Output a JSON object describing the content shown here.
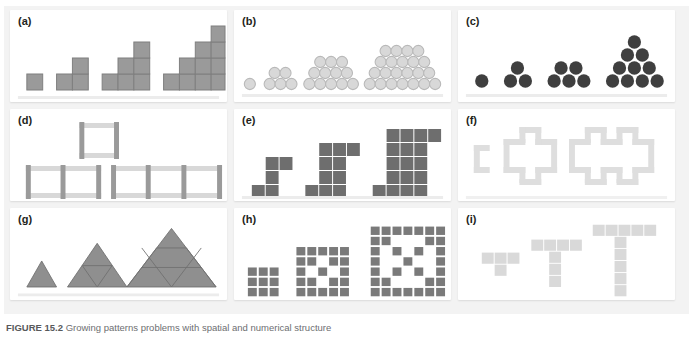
{
  "figure": {
    "caption_label": "FIGURE 15.2",
    "caption_text": "Growing patterns problems with spatial and numerical structure",
    "background": "#f3f3f3",
    "panel_background": "#ffffff"
  },
  "colors": {
    "mid_gray": "#9a9a9a",
    "mid_gray_stroke": "#8a8a8a",
    "light_gray": "#d4d4d4",
    "light_gray_stroke": "#c2c2c2",
    "dark_gray": "#3f3f3f",
    "block_gray": "#6e6e6e",
    "pale_gray": "#e2e2e2",
    "label_color": "#231f20"
  },
  "panels": [
    {
      "id": "a",
      "label": "(a)",
      "name": "panel-a-staircase-squares",
      "type": "staircase-squares",
      "description": "Square tiles arranged in growing staircase shapes",
      "fill": "#9a9a9a",
      "stroke": "#7f7f7f",
      "cell": 14,
      "terms": [
        {
          "index": 1,
          "columns": [
            1
          ],
          "count": 1
        },
        {
          "index": 2,
          "columns": [
            1,
            2
          ],
          "count": 3
        },
        {
          "index": 3,
          "columns": [
            1,
            2,
            3
          ],
          "count": 6
        },
        {
          "index": 4,
          "columns": [
            1,
            2,
            3,
            4
          ],
          "count": 10
        }
      ]
    },
    {
      "id": "b",
      "label": "(b)",
      "name": "panel-b-circle-stacks",
      "type": "circle-triangular-stacks",
      "description": "Light circles stacked in triangular arrays",
      "fill": "#d8d8d8",
      "stroke": "#b9b9b9",
      "radius": 5.2,
      "terms": [
        {
          "index": 1,
          "rows": [
            1
          ],
          "count": 1
        },
        {
          "index": 2,
          "rows": [
            3,
            2
          ],
          "count": 5
        },
        {
          "index": 3,
          "rows": [
            5,
            4,
            3
          ],
          "count": 12
        },
        {
          "index": 4,
          "rows": [
            7,
            6,
            5,
            4
          ],
          "count": 22
        }
      ]
    },
    {
      "id": "c",
      "label": "(c)",
      "name": "panel-c-dark-triangular-numbers",
      "type": "circle-triangles",
      "description": "Dark circles forming triangular numbers",
      "fill": "#3f3f3f",
      "stroke": "#3f3f3f",
      "radius": 6.4,
      "terms": [
        {
          "index": 1,
          "rows": [
            1
          ],
          "count": 1
        },
        {
          "index": 2,
          "rows": [
            2,
            1
          ],
          "count": 3
        },
        {
          "index": 3,
          "rows": [
            3,
            2
          ],
          "count": 5
        },
        {
          "index": 4,
          "rows": [
            5,
            4,
            3,
            2,
            1
          ],
          "count": 15
        }
      ]
    },
    {
      "id": "d",
      "label": "(d)",
      "name": "panel-d-matchstick-squares",
      "type": "matchstick-squares",
      "description": "Toothpick or matchstick squares joined in a row",
      "fill": "#cfcfcf",
      "post_fill": "#8d8d8d",
      "stroke": "#bdbdbd",
      "terms": [
        {
          "index": 1,
          "squares": 1,
          "sticks": 4
        },
        {
          "index": 2,
          "squares": 2,
          "sticks": 7
        },
        {
          "index": 3,
          "squares": 3,
          "sticks": 10
        }
      ]
    },
    {
      "id": "e",
      "label": "(e)",
      "name": "panel-e-block-growth",
      "type": "block-growth",
      "description": "Dark block arrangements growing in width and height",
      "fill": "#6e6e6e",
      "stroke": "#ffffff",
      "cell": 11,
      "terms": [
        {
          "index": 1,
          "count": 5
        },
        {
          "index": 2,
          "count": 12
        },
        {
          "index": 3,
          "count": 22
        }
      ]
    },
    {
      "id": "f",
      "label": "(f)",
      "name": "panel-f-perimeter-fractal",
      "type": "perimeter-outline",
      "description": "Pale gray outlined cross and Koch-island perimeters",
      "fill": "#dedede",
      "stroke": "#cfcfcf",
      "cell": 9,
      "terms": [
        {
          "index": 1,
          "perimeter": 8
        },
        {
          "index": 2,
          "perimeter": 20
        },
        {
          "index": 3,
          "perimeter": 32
        }
      ]
    },
    {
      "id": "g",
      "label": "(g)",
      "name": "panel-g-subdivided-triangles",
      "type": "triangles",
      "description": "Equilateral triangles subdivided into smaller triangles",
      "fill": "#8f8f8f",
      "stroke": "#6f6f6f",
      "terms": [
        {
          "index": 1,
          "side": 1,
          "small_triangles": 1
        },
        {
          "index": 2,
          "side": 2,
          "small_triangles": 4
        },
        {
          "index": 3,
          "side": 3,
          "small_triangles": 9
        }
      ]
    },
    {
      "id": "h",
      "label": "(h)",
      "name": "panel-h-square-fractal",
      "type": "square-fractal",
      "description": "Square grids of small tiles forming nested fractal rings",
      "fill": "#7a7a7a",
      "stroke": "#ffffff",
      "cell": 8,
      "terms": [
        {
          "index": 1,
          "grid": 3,
          "count": 9
        },
        {
          "index": 2,
          "grid": 5,
          "count": 21
        },
        {
          "index": 3,
          "grid": 7,
          "count": 33
        }
      ]
    },
    {
      "id": "i",
      "label": "(i)",
      "name": "panel-i-t-shapes",
      "type": "t-shapes",
      "description": "Pale gray T-shaped tile figures growing in both arms",
      "fill": "#d9d9d9",
      "stroke": "#ffffff",
      "cell": 11,
      "terms": [
        {
          "index": 1,
          "top": 3,
          "stem": 1,
          "count": 4
        },
        {
          "index": 2,
          "top": 4,
          "stem": 3,
          "count": 7
        },
        {
          "index": 3,
          "top": 5,
          "stem": 5,
          "count": 10
        }
      ]
    }
  ]
}
